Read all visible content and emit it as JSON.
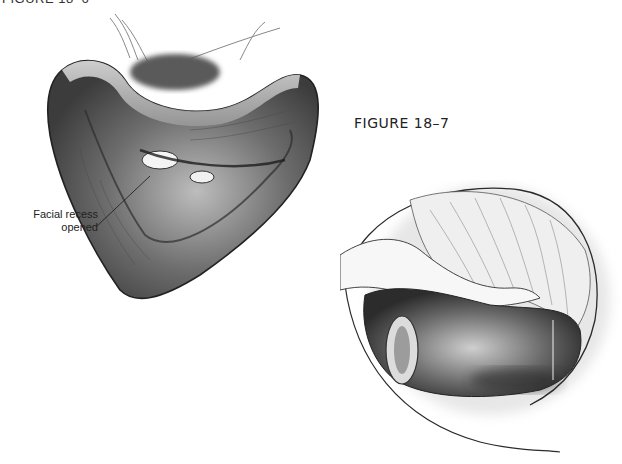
{
  "page": {
    "header_clipped": "FIGURE 18–6"
  },
  "figure": {
    "caption": "FIGURE 18–7"
  },
  "left_illustration": {
    "description": "Mastoid cavity view with facial recess opened",
    "callout": {
      "line1": "Facial recess",
      "line2": "opened"
    }
  },
  "right_illustration": {
    "description": "Middle ear view through opened facial recess"
  },
  "colors": {
    "ink": "#222222",
    "shade_dark": "#3a3a3a",
    "shade_mid": "#8a8a8a",
    "shade_light": "#d8d8d8",
    "background": "#ffffff"
  }
}
